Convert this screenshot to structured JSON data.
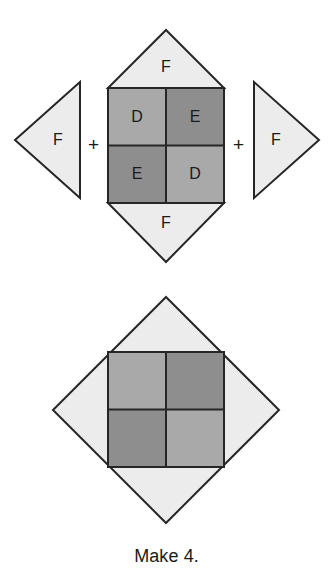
{
  "caption": "Make 4.",
  "operators": {
    "left_plus": "+",
    "right_plus": "+"
  },
  "colors": {
    "background": "#ffffff",
    "outline": "#262626",
    "light_gray": "#ececec",
    "mid_gray": "#a9a9a9",
    "dark_gray": "#8e8e8e"
  },
  "top_assembly": {
    "left_triangle": {
      "label": "F",
      "orientation": "points-left",
      "fill": "light_gray"
    },
    "right_triangle": {
      "label": "F",
      "orientation": "points-right",
      "fill": "light_gray"
    },
    "center_unit": {
      "top_triangle": {
        "label": "F",
        "orientation": "points-up",
        "fill": "light_gray"
      },
      "bottom_triangle": {
        "label": "F",
        "orientation": "points-down",
        "fill": "light_gray"
      },
      "square_quadrants": [
        {
          "position": "top-left",
          "label": "D",
          "fill": "mid_gray"
        },
        {
          "position": "top-right",
          "label": "E",
          "fill": "dark_gray"
        },
        {
          "position": "bottom-left",
          "label": "E",
          "fill": "dark_gray"
        },
        {
          "position": "bottom-right",
          "label": "D",
          "fill": "mid_gray"
        }
      ]
    }
  },
  "bottom_block": {
    "shape": "diamond-on-point",
    "fill": "light_gray",
    "inner_square_quadrants": [
      {
        "position": "top-left",
        "label": "",
        "fill": "mid_gray"
      },
      {
        "position": "top-right",
        "label": "",
        "fill": "dark_gray"
      },
      {
        "position": "bottom-left",
        "label": "",
        "fill": "dark_gray"
      },
      {
        "position": "bottom-right",
        "label": "",
        "fill": "mid_gray"
      }
    ]
  }
}
